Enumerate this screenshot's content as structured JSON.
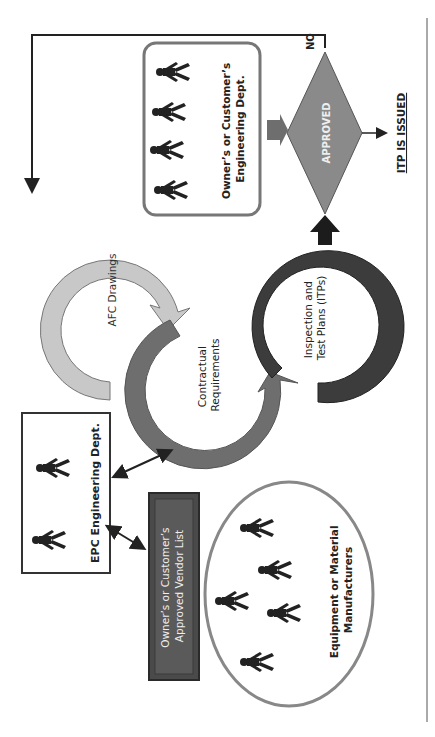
{
  "diagram": {
    "nodes": {
      "epc_dept": {
        "label": "EPC Engineering Dept."
      },
      "owner_eng_dept": {
        "label_line1": "Owner’s or Customer’s",
        "label_line2": "Engineering Dept."
      },
      "vendor_list": {
        "label_line1": "Owner’s or Customer’s",
        "label_line2": "Approved Vendor List"
      },
      "manufacturers": {
        "label_line1": "Equipment or Material",
        "label_line2": "Manufacturers"
      },
      "afc_drawings": {
        "label": "AFC Drawings"
      },
      "contractual": {
        "label_line1": "Contractual",
        "label_line2": "Requirements"
      },
      "itp": {
        "label_line1": "Inspection and",
        "label_line2": "Test Plans (ITPs)"
      },
      "decision": {
        "label": "APPROVED",
        "no_label": "NO"
      },
      "result": {
        "label": "ITP IS ISSUED"
      }
    },
    "colors": {
      "afc": "#c8c8c8",
      "contractual": "#6e6e6e",
      "itp": "#3c3c3c",
      "decision": "#8a8a8a",
      "vendor_box": "#4a4a4a",
      "figure": "#222222",
      "oval_border": "#888888"
    }
  }
}
